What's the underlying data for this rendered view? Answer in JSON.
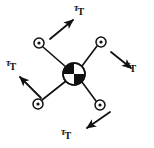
{
  "figure": {
    "background_color": "#ffffff",
    "stroke_color": "#111111",
    "center_body": {
      "name": "center-of-mass-symbol",
      "cx": 74,
      "cy": 74,
      "r": 11,
      "quadrants": [
        "black",
        "white",
        "white",
        "black"
      ],
      "quadrant_colors": {
        "filled": "#111111",
        "empty": "#ffffff"
      }
    },
    "nodes": [
      {
        "id": "node-top-left",
        "cx": 39,
        "cy": 43,
        "r": 5,
        "dot_r": 1.6
      },
      {
        "id": "node-top-right",
        "cx": 101,
        "cy": 42,
        "r": 5,
        "dot_r": 1.6
      },
      {
        "id": "node-bottom-left",
        "cx": 38,
        "cy": 104,
        "r": 5,
        "dot_r": 1.6
      },
      {
        "id": "node-bottom-right",
        "cx": 100,
        "cy": 105,
        "r": 5,
        "dot_r": 1.6
      }
    ],
    "spokes": [
      {
        "id": "spoke-to-top-left",
        "x1": 66,
        "y1": 67,
        "x2": 43,
        "y2": 47
      },
      {
        "id": "spoke-to-top-right",
        "x1": 82,
        "y1": 66,
        "x2": 97,
        "y2": 46
      },
      {
        "id": "spoke-to-bottom-left",
        "x1": 66,
        "y1": 81,
        "x2": 42,
        "y2": 100
      },
      {
        "id": "spoke-to-bottom-right",
        "x1": 82,
        "y1": 82,
        "x2": 96,
        "y2": 101
      }
    ],
    "arrows": [
      {
        "id": "arrow-top",
        "direction": "up-right",
        "x1": 50,
        "y1": 39,
        "x2": 73,
        "y2": 19,
        "label": "torque-label-top"
      },
      {
        "id": "arrow-right",
        "direction": "down-right",
        "x1": 111,
        "y1": 52,
        "x2": 132,
        "y2": 69,
        "label": "torque-label-right"
      },
      {
        "id": "arrow-left",
        "direction": "up-left",
        "x1": 41,
        "y1": 98,
        "x2": 19,
        "y2": 76,
        "label": "torque-label-left"
      },
      {
        "id": "arrow-bottom",
        "direction": "down-left",
        "x1": 110,
        "y1": 112,
        "x2": 86,
        "y2": 129,
        "label": "torque-label-bottom"
      }
    ],
    "labels": {
      "top": {
        "symbol": "τ",
        "subscript": "T"
      },
      "right": {
        "symbol": "τ",
        "subscript": "T"
      },
      "left": {
        "symbol": "τ",
        "subscript": "T"
      },
      "bottom": {
        "symbol": "τ",
        "subscript": "T"
      }
    }
  }
}
